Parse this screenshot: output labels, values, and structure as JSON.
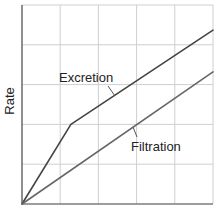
{
  "chart_data": {
    "type": "line",
    "title": "",
    "xlabel": "",
    "ylabel": "Rate",
    "xlim": [
      0,
      5
    ],
    "ylim": [
      0,
      5
    ],
    "grid": true,
    "legend": "none (direct inline labels with leader lines)",
    "x_ticks": [
      0,
      1,
      2,
      3,
      4,
      5
    ],
    "y_ticks": [
      0,
      1,
      2,
      3,
      4,
      5
    ],
    "tick_labels_shown": false,
    "series": [
      {
        "name": "Excretion",
        "color": "#444444",
        "points": [
          [
            0,
            0
          ],
          [
            1.28,
            2.0
          ],
          [
            5.0,
            4.37
          ]
        ]
      },
      {
        "name": "Filtration",
        "color": "#666666",
        "points": [
          [
            0,
            0
          ],
          [
            5.0,
            3.32
          ]
        ]
      }
    ],
    "annotations": [
      {
        "text": "Excretion",
        "points_to_series": "Excretion"
      },
      {
        "text": "Filtration",
        "points_to_series": "Filtration"
      }
    ]
  },
  "labels": {
    "ylabel": "Rate",
    "excretion": "Excretion",
    "filtration": "Filtration"
  },
  "colors": {
    "grid": "#cfcfcf",
    "axis": "#555555",
    "excretion": "#444444",
    "filtration": "#666666",
    "text": "#222222"
  }
}
